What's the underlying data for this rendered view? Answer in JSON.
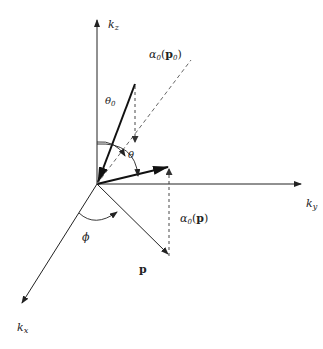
{
  "diagram": {
    "axes": {
      "kz": {
        "label_main": "k",
        "label_sub": "z"
      },
      "ky": {
        "label_main": "k",
        "label_sub": "y"
      },
      "kx": {
        "label_main": "k",
        "label_sub": "x"
      }
    },
    "angles": {
      "theta0": {
        "label_main": "θ",
        "label_sub": "0"
      },
      "theta": {
        "label": "θ"
      },
      "phi": {
        "label": "ϕ"
      }
    },
    "vectors": {
      "p": {
        "label": "p"
      }
    },
    "annotations": {
      "alpha_p0": {
        "prefix": "α",
        "sub": "0",
        "open": "(",
        "arg": "p",
        "arg_sub": "0",
        "close": ")"
      },
      "alpha_p": {
        "prefix": "α",
        "sub": "0",
        "open": "(",
        "arg": "p",
        "close": ")"
      }
    },
    "colors": {
      "line": "#222222",
      "dashed": "#555555",
      "background": "#ffffff"
    }
  }
}
